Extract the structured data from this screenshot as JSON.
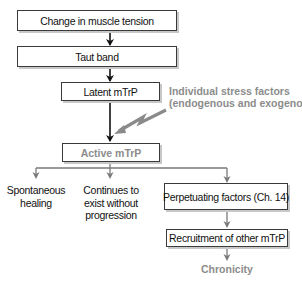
{
  "diagram": {
    "nodes": {
      "change_in_muscle_tension": "Change in muscle tension",
      "taut_band": "Taut band",
      "latent_mtrp": "Latent mTrP",
      "active_mtrp": "Active mTrP",
      "spontaneous_healing": "Spontaneous healing",
      "continues_to_exist": "Continues to exist without progression",
      "perpetuating_factors": "Perpetuating factors (Ch. 14)",
      "recruitment": "Recruitment of other mTrP",
      "chronicity": "Chronicity"
    },
    "labels": {
      "spontaneous_line1": "Spontaneous",
      "spontaneous_line2": "healing",
      "continues_line1": "Continues to",
      "continues_line2": "exist without",
      "continues_line3": "progression",
      "stress_line1": "Individual stress factors",
      "stress_line2": "(endogenous and exogenous)"
    },
    "edges": [
      {
        "from": "Change in muscle tension",
        "to": "Taut band",
        "style": "black"
      },
      {
        "from": "Taut band",
        "to": "Latent mTrP",
        "style": "black"
      },
      {
        "from": "Latent mTrP",
        "to": "Active mTrP",
        "style": "black"
      },
      {
        "from": "Individual stress factors (endogenous and exogenous)",
        "to": "Active mTrP",
        "style": "gray-lightning"
      },
      {
        "from": "Active mTrP",
        "to": "Spontaneous healing",
        "style": "gray"
      },
      {
        "from": "Active mTrP",
        "to": "Continues to exist without progression",
        "style": "gray"
      },
      {
        "from": "Active mTrP",
        "to": "Perpetuating factors (Ch. 14)",
        "style": "gray"
      },
      {
        "from": "Perpetuating factors (Ch. 14)",
        "to": "Recruitment of other mTrP",
        "style": "gray"
      },
      {
        "from": "Recruitment of other mTrP",
        "to": "Chronicity",
        "style": "gray"
      }
    ],
    "colors": {
      "primary_stroke": "#111111",
      "secondary_stroke": "#7a7a7a",
      "highlight_text": "#8c8c8c",
      "shadow": "#c8c8c8"
    }
  }
}
